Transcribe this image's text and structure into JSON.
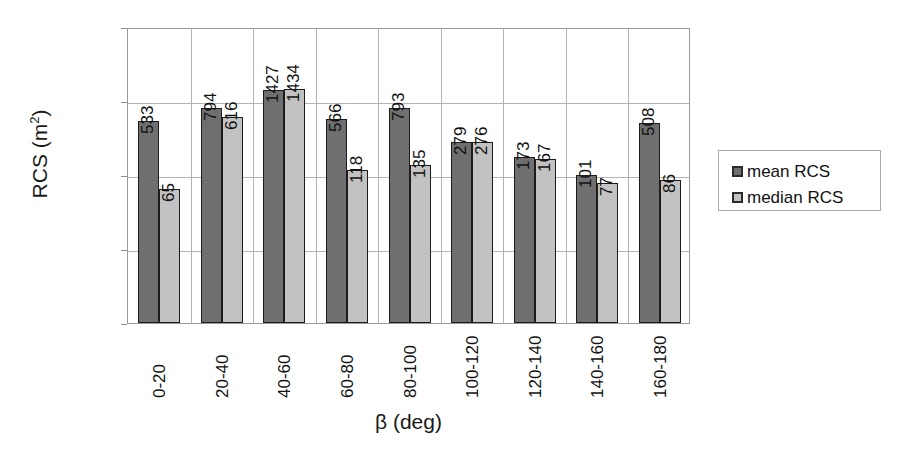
{
  "chart_data": {
    "type": "bar",
    "title": "",
    "xlabel": "β (deg)",
    "ylabel": "RCS (m²)",
    "ylabel_base": "RCS (m",
    "ylabel_sup": "2",
    "ylabel_close": ")",
    "yscale": "log",
    "ylim": [
      1,
      10000
    ],
    "ytick_labels": [
      "10000",
      "1000",
      "100",
      "10",
      "1"
    ],
    "yticks": [
      10000,
      1000,
      100,
      10,
      1
    ],
    "grid": true,
    "legend_position": "right",
    "categories": [
      "0-20",
      "20-40",
      "40-60",
      "60-80",
      "80-100",
      "100-120",
      "120-140",
      "140-160",
      "160-180"
    ],
    "series": [
      {
        "name": "mean RCS",
        "color": "#6f6f6f",
        "values": [
          533,
          794,
          1427,
          566,
          793,
          279,
          173,
          101,
          508
        ]
      },
      {
        "name": "median RCS",
        "color": "#c2c2c2",
        "values": [
          65,
          616,
          1434,
          118,
          135,
          276,
          167,
          77,
          86
        ]
      }
    ],
    "data_labels": [
      {
        "category": "0-20",
        "mean": "533",
        "median": "65"
      },
      {
        "category": "20-40",
        "mean": "794",
        "median": "616"
      },
      {
        "category": "40-60",
        "mean": "1427",
        "median": "1434"
      },
      {
        "category": "60-80",
        "mean": "566",
        "median": "118"
      },
      {
        "category": "80-100",
        "mean": "793",
        "median": "135"
      },
      {
        "category": "100-120",
        "mean": "279",
        "median": "276"
      },
      {
        "category": "120-140",
        "mean": "173",
        "median": "167"
      },
      {
        "category": "140-160",
        "mean": "101",
        "median": "77"
      },
      {
        "category": "160-180",
        "mean": "508",
        "median": "86"
      }
    ]
  },
  "legend": {
    "entries": [
      {
        "label": "mean RCS",
        "swatch": "mean"
      },
      {
        "label": "median RCS",
        "swatch": "median"
      }
    ]
  },
  "colors": {
    "mean_bar": "#6f6f6f",
    "median_bar": "#c2c2c2",
    "bar_outline": "#1c1c1c",
    "gridline": "#b4b4b4",
    "frame": "#9a9a9a",
    "background": "#ffffff",
    "text": "#111111"
  }
}
